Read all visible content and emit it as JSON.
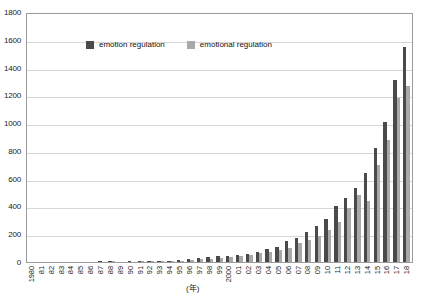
{
  "chart_data": {
    "type": "bar",
    "title": "",
    "xlabel": "(年)",
    "ylabel": "",
    "ylim": [
      0,
      1800
    ],
    "ytick_values": [
      0,
      200,
      400,
      600,
      800,
      1000,
      1200,
      1400,
      1600,
      1800
    ],
    "ytick_labels": [
      "0",
      "200",
      "400",
      "600",
      "800",
      "1000",
      "1200",
      "1400",
      "1600",
      "1800"
    ],
    "grid": true,
    "legend_position": "upper-left-inside",
    "categories": [
      "1980",
      "81",
      "82",
      "83",
      "84",
      "85",
      "86",
      "87",
      "88",
      "89",
      "90",
      "91",
      "92",
      "93",
      "94",
      "95",
      "96",
      "97",
      "98",
      "99",
      "2000",
      "01",
      "02",
      "03",
      "04",
      "05",
      "06",
      "07",
      "08",
      "09",
      "10",
      "11",
      "12",
      "13",
      "14",
      "15",
      "16",
      "17",
      "18"
    ],
    "series": [
      {
        "name": "emotion regulation",
        "color": "#4a4a4a",
        "values": [
          0,
          0,
          0,
          0,
          0,
          0,
          3,
          4,
          5,
          3,
          4,
          6,
          7,
          6,
          9,
          14,
          22,
          28,
          33,
          40,
          44,
          52,
          60,
          75,
          95,
          108,
          150,
          175,
          215,
          260,
          310,
          400,
          460,
          530,
          640,
          820,
          1010,
          1310,
          1545
        ]
      },
      {
        "name": "emotional regulation",
        "color": "#a9a9a9",
        "values": [
          0,
          0,
          0,
          0,
          0,
          0,
          2,
          3,
          4,
          2,
          3,
          4,
          5,
          5,
          7,
          10,
          16,
          20,
          24,
          30,
          35,
          42,
          50,
          62,
          70,
          88,
          100,
          140,
          160,
          190,
          230,
          290,
          390,
          480,
          440,
          700,
          880,
          1180,
          1270
        ]
      }
    ]
  },
  "legend": {
    "items": [
      {
        "label": "emotion regulation",
        "color": "#4a4a4a"
      },
      {
        "label": "emotional regulation",
        "color": "#a9a9a9"
      }
    ]
  },
  "axis": {
    "x_title": "(年)"
  }
}
